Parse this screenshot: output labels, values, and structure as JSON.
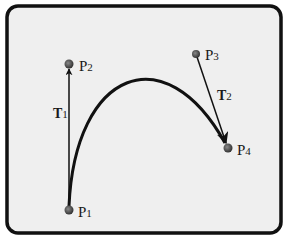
{
  "diagram": {
    "type": "hermite-curve",
    "frame": {
      "background": "#efefef",
      "border": "#111111"
    },
    "points": [
      {
        "id": "P1",
        "label": "P",
        "sub": "1",
        "x": 69,
        "y": 210
      },
      {
        "id": "P2",
        "label": "P",
        "sub": "2",
        "x": 69,
        "y": 64
      },
      {
        "id": "P3",
        "label": "P",
        "sub": "3",
        "x": 196,
        "y": 54
      },
      {
        "id": "P4",
        "label": "P",
        "sub": "4",
        "x": 228,
        "y": 148
      }
    ],
    "tangents": [
      {
        "id": "T1",
        "label": "T",
        "sub": "1",
        "from": "P1",
        "to": "P2"
      },
      {
        "id": "T2",
        "label": "T",
        "sub": "2",
        "from": "P3",
        "to": "P4"
      }
    ],
    "curve": {
      "from": "P1",
      "to": "P4"
    }
  }
}
